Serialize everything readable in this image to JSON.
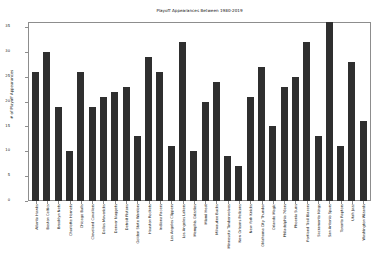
{
  "chart": {
    "title": "Playoff Appearances Between 1980-2019",
    "ylabel": "# of Playoff Appearances",
    "xlabel": ""
  },
  "chart_data": {
    "type": "bar",
    "title": "Playoff Appearances Between 1980-2019",
    "xlabel": "",
    "ylabel": "# of Playoff Appearances",
    "ylim": [
      0,
      36
    ],
    "yticks": [
      0,
      5,
      10,
      15,
      20,
      25,
      30,
      35
    ],
    "grid": false,
    "legend": false,
    "bar_color": "#2f2f2f",
    "categories": [
      "Atlanta Hawks",
      "Boston Celtics",
      "Brooklyn Nets",
      "Charlotte Hornets",
      "Chicago Bulls",
      "Cleveland Cavaliers",
      "Dallas Mavericks",
      "Denver Nuggets",
      "Detroit Pistons",
      "Golden State Warriors",
      "Houston Rockets",
      "Indiana Pacers",
      "Los Angeles Clippers",
      "Los Angeles Lakers",
      "Memphis Grizzlies",
      "Miami Heat",
      "Milwaukee Bucks",
      "Minnesota Timberwolves",
      "New Orleans Pelicans",
      "New York Knicks",
      "Oklahoma City Thunder",
      "Orlando Magic",
      "Philadelphia 76ers",
      "Phoenix Suns",
      "Portland Trail Blazers",
      "Sacramento Kings",
      "San Antonio Spurs",
      "Toronto Raptors",
      "Utah Jazz",
      "Washington Wizards"
    ],
    "values": [
      26,
      30,
      19,
      10,
      26,
      19,
      21,
      22,
      23,
      13,
      29,
      26,
      11,
      32,
      10,
      20,
      24,
      9,
      7,
      21,
      27,
      15,
      23,
      25,
      32,
      13,
      36,
      11,
      28,
      16
    ]
  }
}
